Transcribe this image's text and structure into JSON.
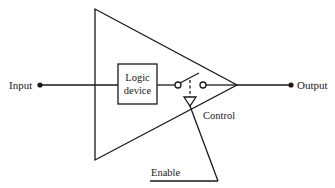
{
  "diagram": {
    "title": "",
    "labels": {
      "input": "Input",
      "output": "Output",
      "logic_line1": "Logic",
      "logic_line2": "device",
      "control": "Control",
      "enable": "Enable"
    },
    "colors": {
      "stroke": "#1a1a1a",
      "background": "#ffffff"
    },
    "components": [
      {
        "id": "input-terminal",
        "type": "terminal"
      },
      {
        "id": "amplifier-triangle",
        "type": "buffer"
      },
      {
        "id": "logic-device",
        "type": "block"
      },
      {
        "id": "switch",
        "type": "switch"
      },
      {
        "id": "control-input",
        "type": "triangle"
      },
      {
        "id": "output-terminal",
        "type": "terminal"
      }
    ]
  }
}
